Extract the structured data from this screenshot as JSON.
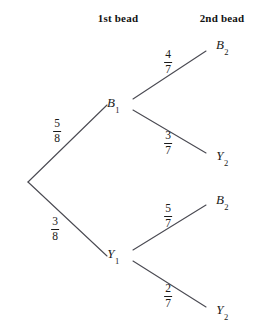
{
  "diagram": {
    "type": "probability-tree",
    "width": 262,
    "height": 329,
    "background_color": "#ffffff",
    "line_color": "#4a4a52",
    "text_color": "#1a1a1a"
  },
  "headers": [
    {
      "id": "stage1",
      "label": "1st bead",
      "x": 118,
      "y": 18
    },
    {
      "id": "stage2",
      "label": "2nd bead",
      "x": 222,
      "y": 18
    }
  ],
  "nodes": [
    {
      "id": "root",
      "label": "",
      "sub": "",
      "x": 28,
      "y": 182,
      "label_x": 28,
      "label_y": 182,
      "show_label": false
    },
    {
      "id": "b1",
      "label": "B",
      "sub": "1",
      "x": 123,
      "y": 104,
      "label_x": 113,
      "label_y": 104,
      "show_label": true
    },
    {
      "id": "y1",
      "label": "Y",
      "sub": "1",
      "x": 123,
      "y": 255,
      "label_x": 113,
      "label_y": 255,
      "show_label": true
    },
    {
      "id": "b1b2",
      "label": "B",
      "sub": "2",
      "x": 208,
      "y": 48,
      "label_x": 222,
      "label_y": 46,
      "show_label": true
    },
    {
      "id": "b1y2",
      "label": "Y",
      "sub": "2",
      "x": 208,
      "y": 156,
      "label_x": 222,
      "label_y": 157,
      "show_label": true
    },
    {
      "id": "y1b2",
      "label": "B",
      "sub": "2",
      "x": 208,
      "y": 202,
      "label_x": 222,
      "label_y": 201,
      "show_label": true
    },
    {
      "id": "y1y2",
      "label": "Y",
      "sub": "2",
      "x": 208,
      "y": 310,
      "label_x": 222,
      "label_y": 311,
      "show_label": true
    }
  ],
  "branches": [
    {
      "id": "root-b1",
      "from": "root",
      "to": "b1",
      "x1": 28,
      "y1": 182,
      "x2": 107,
      "y2": 105,
      "numerator": "5",
      "denominator": "8",
      "probability": 0.625,
      "label_x": 57,
      "label_y": 131
    },
    {
      "id": "root-y1",
      "from": "root",
      "to": "y1",
      "x1": 28,
      "y1": 182,
      "x2": 107,
      "y2": 256,
      "numerator": "3",
      "denominator": "8",
      "probability": 0.375,
      "label_x": 55,
      "label_y": 229
    },
    {
      "id": "b1-b2",
      "from": "b1",
      "to": "b1b2",
      "x1": 133,
      "y1": 99,
      "x2": 206,
      "y2": 51,
      "numerator": "4",
      "denominator": "7",
      "probability": 0.571,
      "label_x": 168,
      "label_y": 62
    },
    {
      "id": "b1-y2",
      "from": "b1",
      "to": "b1y2",
      "x1": 133,
      "y1": 110,
      "x2": 206,
      "y2": 153,
      "numerator": "3",
      "denominator": "7",
      "probability": 0.429,
      "label_x": 168,
      "label_y": 143
    },
    {
      "id": "y1-b2",
      "from": "y1",
      "to": "y1b2",
      "x1": 133,
      "y1": 250,
      "x2": 206,
      "y2": 205,
      "numerator": "5",
      "denominator": "7",
      "probability": 0.714,
      "label_x": 168,
      "label_y": 216
    },
    {
      "id": "y1-y2",
      "from": "y1",
      "to": "y1y2",
      "x1": 133,
      "y1": 261,
      "x2": 206,
      "y2": 307,
      "numerator": "2",
      "denominator": "7",
      "probability": 0.286,
      "label_x": 168,
      "label_y": 296
    }
  ]
}
